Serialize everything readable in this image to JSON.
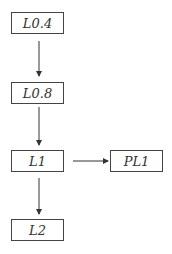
{
  "diagram": {
    "type": "flowchart",
    "nodes": [
      {
        "id": "L0.4",
        "label": "L0.4",
        "x": 11,
        "y": 12,
        "w": 53,
        "h": 22
      },
      {
        "id": "L0.8",
        "label": "L0.8",
        "x": 11,
        "y": 82,
        "w": 53,
        "h": 22
      },
      {
        "id": "L1",
        "label": "L1",
        "x": 11,
        "y": 150,
        "w": 53,
        "h": 22
      },
      {
        "id": "PL1",
        "label": "PL1",
        "x": 110,
        "y": 150,
        "w": 53,
        "h": 22
      },
      {
        "id": "L2",
        "label": "L2",
        "x": 11,
        "y": 219,
        "w": 53,
        "h": 22
      }
    ],
    "edges": [
      {
        "from": "L0.4",
        "to": "L0.8",
        "direction": "down"
      },
      {
        "from": "L0.8",
        "to": "L1",
        "direction": "down"
      },
      {
        "from": "L1",
        "to": "PL1",
        "direction": "right"
      },
      {
        "from": "L1",
        "to": "L2",
        "direction": "down"
      }
    ],
    "colors": {
      "line": "#333333",
      "border": "#444444",
      "text": "#333333",
      "background": "#ffffff"
    }
  }
}
